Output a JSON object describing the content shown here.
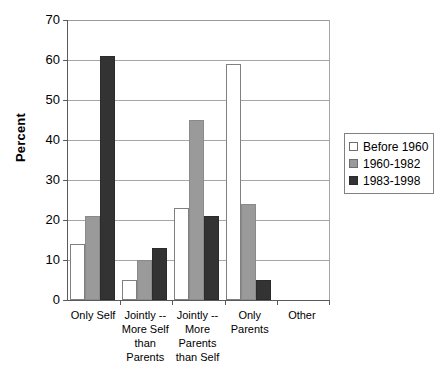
{
  "chart_data": {
    "type": "bar",
    "title": "",
    "xlabel": "",
    "ylabel": "Percent",
    "ylim": [
      0,
      70
    ],
    "ytick_step": 10,
    "yticks": [
      70,
      60,
      50,
      40,
      30,
      20,
      10,
      0
    ],
    "grid": true,
    "legend_position": "right",
    "categories": [
      "Only Self",
      "Jointly -- More Self than Parents",
      "Jointly -- More Parents than Self",
      "Only Parents",
      "Other"
    ],
    "category_label_lines": [
      [
        "Only Self"
      ],
      [
        "Jointly --",
        "More Self",
        "than",
        "Parents"
      ],
      [
        "Jointly --",
        "More",
        "Parents",
        "than Self"
      ],
      [
        "Only",
        "Parents"
      ],
      [
        "Other"
      ]
    ],
    "series": [
      {
        "name": "Before 1960",
        "color": "#ffffff",
        "values": [
          14,
          5,
          23,
          59,
          0
        ]
      },
      {
        "name": "1960-1982",
        "color": "#9a9a9a",
        "values": [
          21,
          10,
          45,
          24,
          0
        ]
      },
      {
        "name": "1983-1998",
        "color": "#333333",
        "values": [
          61,
          13,
          21,
          5,
          0
        ]
      }
    ]
  },
  "legend": {
    "entries": [
      {
        "label": "Before 1960"
      },
      {
        "label": "1960-1982"
      },
      {
        "label": "1983-1998"
      }
    ]
  },
  "axis": {
    "y_title": "Percent",
    "y_tick_labels": [
      "70",
      "60",
      "50",
      "40",
      "30",
      "20",
      "10",
      "0"
    ]
  }
}
